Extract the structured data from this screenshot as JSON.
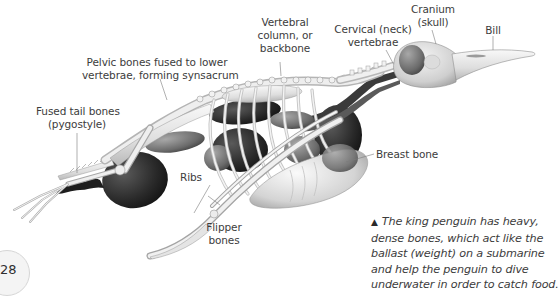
{
  "diagram": {
    "labels": {
      "vertebral_column": [
        "Vertebral",
        "column, or",
        "backbone"
      ],
      "cervical": [
        "Cervical (neck)",
        "vertebrae"
      ],
      "cranium": [
        "Cranium",
        "(skull)"
      ],
      "bill": [
        "Bill"
      ],
      "pelvic": [
        "Pelvic bones fused to lower",
        "vertebrae, forming synsacrum"
      ],
      "pygostyle": [
        "Fused tail bones",
        "(pygostyle)"
      ],
      "breast_bone": [
        "Breast bone"
      ],
      "ribs": [
        "Ribs"
      ],
      "flipper": [
        "Flipper",
        "bones"
      ]
    },
    "caption": {
      "marker": "▲",
      "lines": [
        "The king penguin has heavy,",
        "dense bones, which act like the",
        "ballast (weight) on a submarine",
        "and help the penguin to dive",
        "underwater in order to catch food."
      ]
    },
    "page_number": "28",
    "colors": {
      "bone": "#e6e6e6",
      "bone_outline": "#9a9a9a",
      "organ_dark": "#2b2b2b",
      "organ_mid": "#6f6f6f",
      "leader_line": "#7a7a7a",
      "text": "#3c3c3c"
    }
  }
}
